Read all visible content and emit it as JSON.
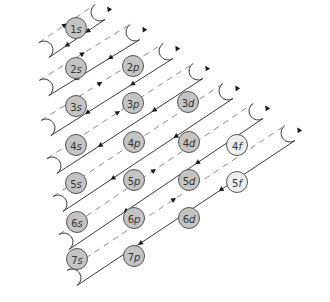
{
  "diagram": {
    "type": "aufbau-filling-order",
    "colors": {
      "filled_orbital": "#c4c4c4",
      "f_orbital": "#eeeeee",
      "line": "#3a3a3a",
      "dashed": "#8a8a8a"
    },
    "orbitals": [
      {
        "label": "1s",
        "x": 76,
        "y": 28,
        "type": "s"
      },
      {
        "label": "2s",
        "x": 76,
        "y": 68,
        "type": "s"
      },
      {
        "label": "2p",
        "x": 133,
        "y": 66,
        "type": "p"
      },
      {
        "label": "3s",
        "x": 76,
        "y": 106,
        "type": "s"
      },
      {
        "label": "3p",
        "x": 133,
        "y": 103,
        "type": "p"
      },
      {
        "label": "3d",
        "x": 188,
        "y": 102,
        "type": "d"
      },
      {
        "label": "4s",
        "x": 76,
        "y": 145,
        "type": "s"
      },
      {
        "label": "4p",
        "x": 134,
        "y": 142,
        "type": "p"
      },
      {
        "label": "4d",
        "x": 189,
        "y": 142,
        "type": "d"
      },
      {
        "label": "4f",
        "x": 237,
        "y": 145,
        "type": "f"
      },
      {
        "label": "5s",
        "x": 76,
        "y": 183,
        "type": "s"
      },
      {
        "label": "5p",
        "x": 134,
        "y": 180,
        "type": "p"
      },
      {
        "label": "5d",
        "x": 189,
        "y": 180,
        "type": "d"
      },
      {
        "label": "5f",
        "x": 237,
        "y": 182,
        "type": "f"
      },
      {
        "label": "6s",
        "x": 77,
        "y": 222,
        "type": "s"
      },
      {
        "label": "6p",
        "x": 134,
        "y": 218,
        "type": "p"
      },
      {
        "label": "6d",
        "x": 189,
        "y": 218,
        "type": "d"
      },
      {
        "label": "7s",
        "x": 77,
        "y": 259,
        "type": "s"
      },
      {
        "label": "7p",
        "x": 134,
        "y": 256,
        "type": "p"
      }
    ],
    "filling_order": [
      "1s",
      "2s",
      "2p",
      "3s",
      "3p",
      "4s",
      "3d",
      "4p",
      "5s",
      "4d",
      "5p",
      "6s",
      "4f",
      "5d",
      "6p",
      "7s",
      "5f",
      "6d",
      "7p"
    ]
  }
}
